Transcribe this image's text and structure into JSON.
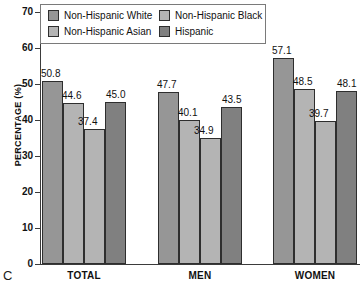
{
  "panel_letter": "C",
  "legend": {
    "entries": [
      {
        "label": "Non-Hispanic White",
        "color": "#969696"
      },
      {
        "label": "Non-Hispanic Black",
        "color": "#b4b4b4"
      },
      {
        "label": "Non-Hispanic Asian",
        "color": "#b4b4b4"
      },
      {
        "label": "Hispanic",
        "color": "#808080"
      }
    ]
  },
  "chart_data": {
    "type": "bar",
    "title": "",
    "xlabel": "",
    "ylabel": "PERCENTAGE (%)",
    "ylim": [
      0,
      70
    ],
    "yticks": [
      0,
      10,
      20,
      30,
      40,
      50,
      60,
      70
    ],
    "ytick_labels": [
      "0",
      "10",
      "20",
      "30",
      "40",
      "50",
      "60",
      "70"
    ],
    "grid": false,
    "legend_position": "top-left",
    "categories": [
      "TOTAL",
      "MEN",
      "WOMEN"
    ],
    "series": [
      {
        "name": "Non-Hispanic White",
        "color": "#969696",
        "values": [
          50.8,
          47.7,
          57.1
        ]
      },
      {
        "name": "Non-Hispanic Black",
        "color": "#b4b4b4",
        "values": [
          44.6,
          40.1,
          48.5
        ]
      },
      {
        "name": "Non-Hispanic Asian",
        "color": "#b4b4b4",
        "values": [
          37.4,
          34.9,
          39.7
        ]
      },
      {
        "name": "Hispanic",
        "color": "#808080",
        "values": [
          45.0,
          43.5,
          48.1
        ]
      }
    ],
    "value_labels": [
      [
        "50.8",
        "44.6",
        "37.4",
        "45.0"
      ],
      [
        "47.7",
        "40.1",
        "34.9",
        "43.5"
      ],
      [
        "57.1",
        "48.5",
        "39.7",
        "48.1"
      ]
    ]
  }
}
